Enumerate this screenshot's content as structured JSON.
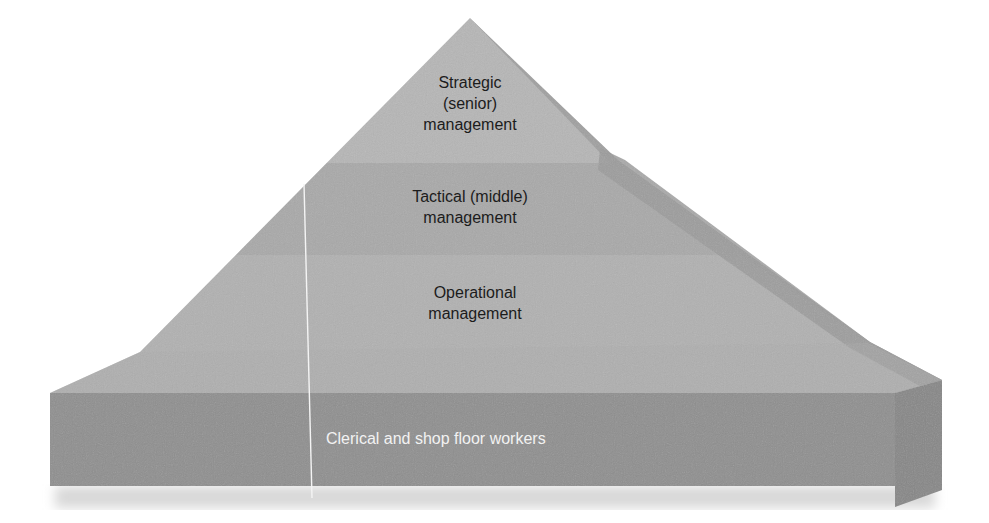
{
  "diagram": {
    "type": "hierarchy-pyramid",
    "levels": [
      {
        "label_line1": "Strategic",
        "label_line2": "(senior)",
        "label_line3": "management",
        "color": "#b4b4b4"
      },
      {
        "label_line1": "Tactical (middle)",
        "label_line2": "management",
        "color": "#a9a9a9"
      },
      {
        "label_line1": "Operational",
        "label_line2": "management",
        "color": "#b0b0b0"
      },
      {
        "label": "Clerical and shop floor workers",
        "color": "#8e8e8e"
      }
    ],
    "colors": {
      "side_face": "#9a9a9a",
      "base_side": "#858585",
      "base_top": "#a8a8a8",
      "text_dark": "#1c1c1c",
      "text_light": "#f2f2f2"
    }
  }
}
